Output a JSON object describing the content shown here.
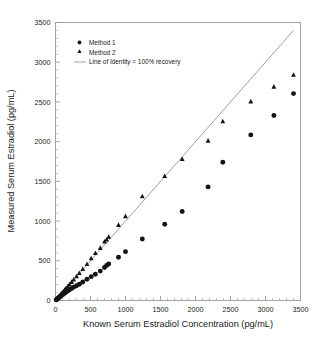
{
  "chart_data": {
    "type": "scatter",
    "title": "",
    "xlabel": "Known Serum Estradiol Concentration (pg/mL)",
    "ylabel": "Measured Serum Estradiol (pg/mL)",
    "xlim": [
      0,
      3500
    ],
    "ylim": [
      0,
      3500
    ],
    "xticks": [
      0,
      500,
      1000,
      1500,
      2000,
      2500,
      3000,
      3500
    ],
    "yticks": [
      0,
      500,
      1000,
      1500,
      2000,
      2500,
      3000,
      3500
    ],
    "xticklabels": [
      "0",
      "500",
      "1000",
      "1500",
      "2000",
      "2500",
      "3000",
      "3500"
    ],
    "yticklabels": [
      "0",
      "500",
      "1000",
      "1500",
      "2000",
      "2500",
      "3000",
      "3500"
    ],
    "x_minor_interval": 100,
    "y_minor_interval": 100,
    "grid": false,
    "legend_position": "upper-left-inside",
    "marker_color": "#141414",
    "line_color": "#8c8c8c",
    "legend": [
      {
        "label": "Method 1",
        "marker": "circle"
      },
      {
        "label": "Method 2",
        "marker": "triangle"
      },
      {
        "label": "Line of Identity = 100% recovery",
        "marker": "line"
      }
    ],
    "series": [
      {
        "name": "Method 1",
        "marker": "circle",
        "points": [
          [
            10,
            8
          ],
          [
            20,
            15
          ],
          [
            30,
            22
          ],
          [
            40,
            30
          ],
          [
            50,
            38
          ],
          [
            60,
            45
          ],
          [
            75,
            55
          ],
          [
            90,
            65
          ],
          [
            110,
            78
          ],
          [
            130,
            92
          ],
          [
            150,
            105
          ],
          [
            175,
            120
          ],
          [
            200,
            135
          ],
          [
            230,
            152
          ],
          [
            260,
            168
          ],
          [
            300,
            185
          ],
          [
            340,
            205
          ],
          [
            390,
            232
          ],
          [
            450,
            268
          ],
          [
            510,
            300
          ],
          [
            570,
            330
          ],
          [
            640,
            370
          ],
          [
            700,
            415
          ],
          [
            730,
            440
          ],
          [
            760,
            460
          ],
          [
            900,
            545
          ],
          [
            1000,
            615
          ],
          [
            1240,
            775
          ],
          [
            1560,
            960
          ],
          [
            1810,
            1120
          ],
          [
            2180,
            1430
          ],
          [
            2390,
            1740
          ],
          [
            2790,
            2085
          ],
          [
            3120,
            2330
          ],
          [
            3400,
            2605
          ]
        ]
      },
      {
        "name": "Method 2",
        "marker": "triangle",
        "points": [
          [
            10,
            10
          ],
          [
            20,
            20
          ],
          [
            30,
            30
          ],
          [
            40,
            40
          ],
          [
            50,
            50
          ],
          [
            60,
            60
          ],
          [
            75,
            76
          ],
          [
            90,
            92
          ],
          [
            110,
            112
          ],
          [
            130,
            133
          ],
          [
            150,
            152
          ],
          [
            175,
            178
          ],
          [
            200,
            203
          ],
          [
            230,
            232
          ],
          [
            260,
            262
          ],
          [
            300,
            302
          ],
          [
            340,
            344
          ],
          [
            390,
            394
          ],
          [
            450,
            458
          ],
          [
            510,
            530
          ],
          [
            570,
            596
          ],
          [
            640,
            660
          ],
          [
            700,
            740
          ],
          [
            730,
            765
          ],
          [
            760,
            800
          ],
          [
            900,
            950
          ],
          [
            1000,
            1060
          ],
          [
            1240,
            1310
          ],
          [
            1560,
            1565
          ],
          [
            1810,
            1780
          ],
          [
            2180,
            2010
          ],
          [
            2390,
            2255
          ],
          [
            2790,
            2505
          ],
          [
            3120,
            2690
          ],
          [
            3400,
            2840
          ]
        ]
      }
    ],
    "reference_line": {
      "name": "Line of Identity = 100% recovery",
      "x": [
        0,
        3400
      ],
      "y": [
        0,
        3400
      ],
      "slope": 1,
      "intercept": 0
    }
  }
}
